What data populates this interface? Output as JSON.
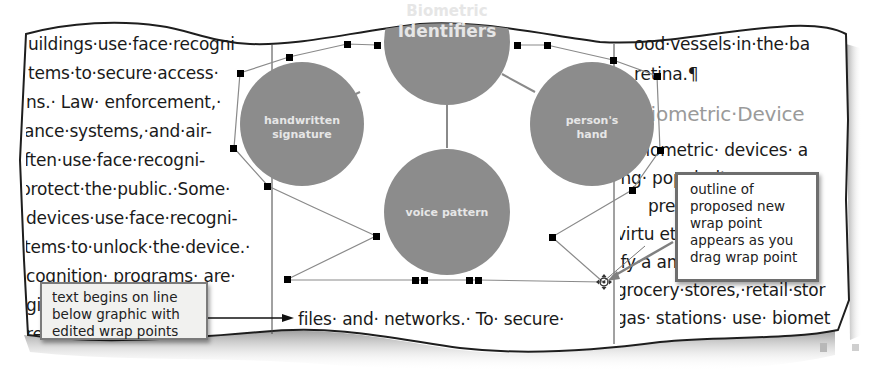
{
  "left_column": {
    "lines": [
      "uildings·use·face·recogni",
      "tems·to·secure·access·",
      "ns.· Law· enforcement,·",
      "ance·systems,·and·air-",
      "ften·use·face·recogni-",
      "protect·the·public.·Some·",
      "devices·use·face·recogni-",
      "tems·to·unlock·the·device.·",
      "cognition· programs· are·",
      "gi                         ated·",
      "re                          th·or·"
    ]
  },
  "middle_column": {
    "below_graphic_line": "files· and· networks.· To· secure·"
  },
  "right_column": {
    "lines": [
      "ood·vessels·in·the·ba",
      "retina.¶"
    ],
    "heading": "Biometric·Device",
    "body_lines": [
      "Biometric· devices· a",
      "ing· popularity· ns· a",
      "pre                          e· th",
      "virtu                        etho",
      "ify·a                        ampl",
      "grocery·stores,·retail·stor",
      "gas· stations· use· biomet"
    ]
  },
  "diagram": {
    "circle_color": "#8c8c8c",
    "label_color": "#e6e6e6",
    "center": {
      "label_line1": "Biometric",
      "label_line2": "Identifiers"
    },
    "nodes": [
      {
        "id": "handwritten",
        "line1": "handwritten",
        "line2": "signature"
      },
      {
        "id": "hand",
        "line1": "person's",
        "line2": "hand"
      },
      {
        "id": "voice",
        "line1": "voice pattern",
        "line2": ""
      }
    ],
    "wrap_handle_color": "#000000",
    "wrap_outline_color": "#8a8a8a"
  },
  "callouts": {
    "left": {
      "lines": [
        "text begins on line",
        "below graphic with",
        "edited wrap points"
      ]
    },
    "right": {
      "lines": [
        "outline of",
        "proposed new",
        "wrap point",
        "appears as you",
        "drag wrap point"
      ]
    }
  },
  "icons": {
    "move_cursor": "move-crosshair-icon",
    "pilcrow": "¶"
  }
}
